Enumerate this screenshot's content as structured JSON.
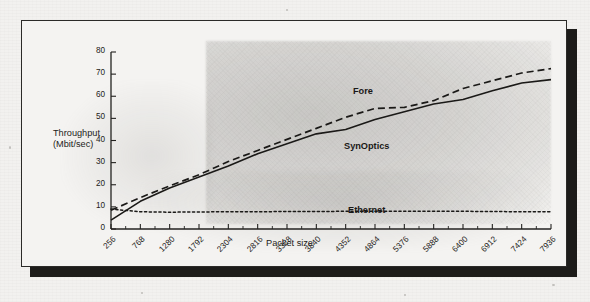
{
  "figure": {
    "kind": "scanned-line-chart",
    "frame_color": "#2b2a28",
    "paper_color": "#f2f1ef",
    "shadow_color": "#1d1c1a"
  },
  "chart_data": {
    "type": "line",
    "title": "",
    "xlabel": "Packet size",
    "ylabel_lines": [
      "Throughput",
      "(Mbit/sec)"
    ],
    "ylabel": "Throughput (Mbit/sec)",
    "xlim": [
      256,
      7936
    ],
    "ylim": [
      0,
      80
    ],
    "grid": false,
    "legend_position": "inline-annotations",
    "y_ticks": [
      0,
      10,
      20,
      30,
      40,
      50,
      60,
      70,
      80
    ],
    "x_ticks": [
      256,
      768,
      1280,
      1792,
      2304,
      2816,
      3328,
      3840,
      4352,
      4864,
      5376,
      5888,
      6400,
      6912,
      7424,
      7936
    ],
    "x": [
      256,
      768,
      1280,
      1792,
      2304,
      2816,
      3328,
      3840,
      4352,
      4864,
      5376,
      5888,
      6400,
      6912,
      7424,
      7936
    ],
    "series": [
      {
        "name": "Fore",
        "style": "dashed",
        "color": "#1a1917",
        "values": [
          8.5,
          14.2,
          19.5,
          24.5,
          30.5,
          35.5,
          40.5,
          45.5,
          50.5,
          54.5,
          55.0,
          58.0,
          63.5,
          67.0,
          70.5,
          72.5
        ]
      },
      {
        "name": "SynOptics",
        "style": "solid",
        "color": "#1a1917",
        "values": [
          4.0,
          12.5,
          18.5,
          23.5,
          28.5,
          34.0,
          38.5,
          43.0,
          45.0,
          49.5,
          53.0,
          56.5,
          58.5,
          62.5,
          66.0,
          67.5
        ]
      },
      {
        "name": "Ethernet",
        "style": "dotted",
        "color": "#1a1917",
        "values": [
          9.0,
          7.8,
          7.6,
          7.7,
          7.8,
          7.8,
          7.9,
          7.9,
          8.0,
          8.0,
          8.0,
          8.0,
          8.0,
          7.9,
          7.8,
          7.8
        ]
      }
    ],
    "annotations": [
      {
        "text": "Fore",
        "x": 4352,
        "y": 60.5
      },
      {
        "text": "SynOptics",
        "x": 4100,
        "y": 36.5
      },
      {
        "text": "Ethernet",
        "x": 4200,
        "y": 13.5
      }
    ]
  }
}
